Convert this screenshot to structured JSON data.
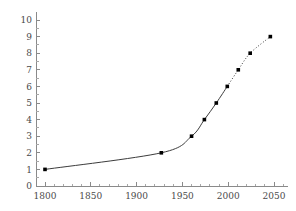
{
  "chart_data": {
    "type": "line",
    "title": "",
    "subtitle": "",
    "xlabel": "",
    "ylabel": "",
    "xlim": [
      1780,
      2065
    ],
    "ylim": [
      0,
      10.6
    ],
    "grid": false,
    "legend": null,
    "x_ticks": [
      1800,
      1850,
      1900,
      1950,
      2000,
      2050
    ],
    "x_tick_labels": [
      "1800",
      "1850",
      "1900",
      "1950",
      "2000",
      "2050"
    ],
    "x_minor_ticks": [
      1810,
      1820,
      1830,
      1840,
      1860,
      1870,
      1880,
      1890,
      1910,
      1920,
      1930,
      1940,
      1960,
      1970,
      1980,
      1990,
      2010,
      2020,
      2030,
      2040,
      2060
    ],
    "y_ticks": [
      0,
      1,
      2,
      3,
      4,
      5,
      6,
      7,
      8,
      9,
      10
    ],
    "y_tick_labels": [
      "0",
      "1",
      "2",
      "3",
      "4",
      "5",
      "6",
      "7",
      "8",
      "9",
      "10"
    ],
    "series": [
      {
        "name": "observed",
        "style": "solid",
        "marker": "square",
        "x": [
          1800,
          1927,
          1960,
          1974,
          1987,
          1999
        ],
        "values": [
          1.0,
          2.0,
          3.0,
          4.0,
          5.0,
          6.0
        ]
      },
      {
        "name": "projected",
        "style": "dotted",
        "marker": "square",
        "x": [
          1999,
          2011,
          2024,
          2046
        ],
        "values": [
          6.0,
          7.0,
          8.0,
          9.0
        ]
      }
    ],
    "annotations": [],
    "colors": {
      "line": "#3c3c3c",
      "marker": "#000000",
      "axis": "#8a8a8a",
      "tick_label": "#4a4a4a",
      "background": "#ffffff"
    }
  }
}
